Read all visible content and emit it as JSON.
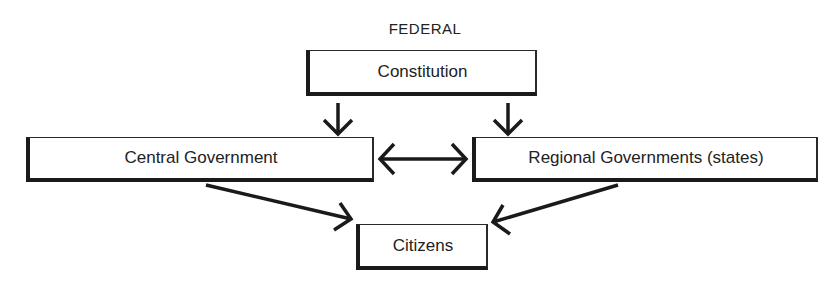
{
  "diagram": {
    "title": "FEDERAL",
    "nodes": {
      "constitution": {
        "label": "Constitution"
      },
      "central": {
        "label": "Central Government"
      },
      "regional": {
        "label": "Regional Governments (states)"
      },
      "citizens": {
        "label": "Citizens"
      }
    },
    "edges": [
      {
        "from": "Constitution",
        "to": "Central Government",
        "type": "directed"
      },
      {
        "from": "Constitution",
        "to": "Regional Governments (states)",
        "type": "directed"
      },
      {
        "from": "Central Government",
        "to": "Regional Governments (states)",
        "type": "bidirectional"
      },
      {
        "from": "Central Government",
        "to": "Citizens",
        "type": "directed"
      },
      {
        "from": "Regional Governments (states)",
        "to": "Citizens",
        "type": "directed"
      }
    ],
    "colors": {
      "stroke": "#1a1a1a",
      "background": "#ffffff"
    }
  }
}
